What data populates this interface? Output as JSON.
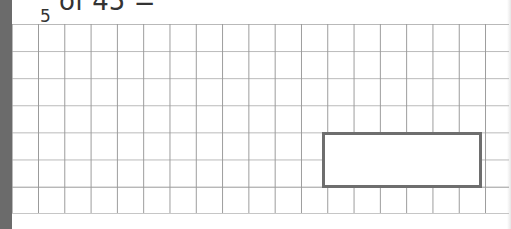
{
  "question": {
    "numerator": "",
    "denominator": "5",
    "text": "of 45 ="
  },
  "grid": {
    "rows": 7,
    "columns": 19
  },
  "answer_box": {
    "value": ""
  },
  "colors": {
    "strip": "#6b6b6b",
    "grid_line": "#b0b0b0",
    "box_border": "#6e6e6e"
  }
}
